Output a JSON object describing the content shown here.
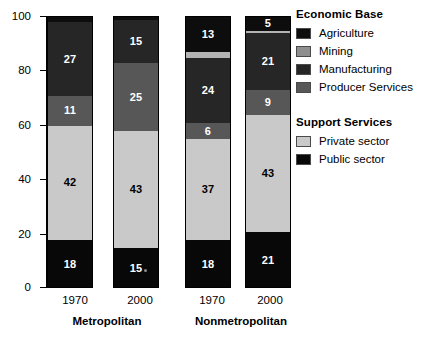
{
  "chart_data": {
    "type": "bar",
    "subtype": "stacked-100-percent",
    "title": "",
    "xlabel": "",
    "ylabel": "",
    "ylim": [
      0,
      100
    ],
    "yticks": [
      0,
      20,
      40,
      60,
      80,
      100
    ],
    "ytick_labels": [
      "0",
      "20",
      "40",
      "60",
      "80",
      "100"
    ],
    "grid": false,
    "legend_position": "right",
    "categories": [
      "1970",
      "2000",
      "1970",
      "2000"
    ],
    "groups": [
      {
        "label": "Metropolitan",
        "categories": [
          "1970",
          "2000"
        ]
      },
      {
        "label": "Nonmetropolitan",
        "categories": [
          "1970",
          "2000"
        ]
      }
    ],
    "series": [
      {
        "name": "Agriculture",
        "color": "#0d0d0d",
        "values": [
          2,
          1,
          13,
          5
        ]
      },
      {
        "name": "Mining",
        "color": "#b3b3b3",
        "values": [
          0,
          0,
          2,
          1
        ]
      },
      {
        "name": "Manufacturing",
        "color": "#262626",
        "values": [
          27,
          15,
          24,
          21
        ]
      },
      {
        "name": "Producer Services",
        "color": "#575757",
        "values": [
          11,
          25,
          6,
          9
        ]
      },
      {
        "name": "Private sector",
        "color": "#c9c9c9",
        "values": [
          42,
          43,
          37,
          43
        ]
      },
      {
        "name": "Public sector",
        "color": "#080808",
        "values": [
          18,
          15,
          18,
          21
        ]
      }
    ],
    "bars": [
      {
        "id": "metro-1970",
        "group": "Metropolitan",
        "category": "1970",
        "segments": [
          {
            "series": "Agriculture",
            "value": 2,
            "label": "",
            "label_color": "light"
          },
          {
            "series": "Manufacturing",
            "value": 27,
            "label": "27",
            "label_color": "light"
          },
          {
            "series": "Producer Services",
            "value": 11,
            "label": "11",
            "label_color": "light"
          },
          {
            "series": "Private sector",
            "value": 42,
            "label": "42",
            "label_color": "dark"
          },
          {
            "series": "Public sector",
            "value": 18,
            "label": "18",
            "label_color": "light"
          }
        ]
      },
      {
        "id": "metro-2000",
        "group": "Metropolitan",
        "category": "2000",
        "segments": [
          {
            "series": "Agriculture",
            "value": 1,
            "label": "",
            "label_color": "light"
          },
          {
            "series": "Manufacturing",
            "value": 16,
            "label": "15",
            "label_color": "light"
          },
          {
            "series": "Producer Services",
            "value": 25,
            "label": "25",
            "label_color": "light"
          },
          {
            "series": "Private sector",
            "value": 43,
            "label": "43",
            "label_color": "dark"
          },
          {
            "series": "Public sector",
            "value": 15,
            "label": "15",
            "label_color": "light"
          }
        ]
      },
      {
        "id": "nonmetro-1970",
        "group": "Nonmetropolitan",
        "category": "1970",
        "segments": [
          {
            "series": "Agriculture",
            "value": 13,
            "label": "13",
            "label_color": "light"
          },
          {
            "series": "Mining",
            "value": 2,
            "label": "",
            "label_color": "dark"
          },
          {
            "series": "Manufacturing",
            "value": 24,
            "label": "24",
            "label_color": "light"
          },
          {
            "series": "Producer Services",
            "value": 6,
            "label": "6",
            "label_color": "light"
          },
          {
            "series": "Private sector",
            "value": 37,
            "label": "37",
            "label_color": "dark"
          },
          {
            "series": "Public sector",
            "value": 18,
            "label": "18",
            "label_color": "light"
          }
        ]
      },
      {
        "id": "nonmetro-2000",
        "group": "Nonmetropolitan",
        "category": "2000",
        "segments": [
          {
            "series": "Agriculture",
            "value": 5,
            "label": "5",
            "label_color": "light"
          },
          {
            "series": "Mining",
            "value": 1,
            "label": "",
            "label_color": "dark"
          },
          {
            "series": "Manufacturing",
            "value": 21,
            "label": "21",
            "label_color": "light"
          },
          {
            "series": "Producer Services",
            "value": 9,
            "label": "9",
            "label_color": "light"
          },
          {
            "series": "Private sector",
            "value": 43,
            "label": "43",
            "label_color": "dark"
          },
          {
            "series": "Public sector",
            "value": 21,
            "label": "21",
            "label_color": "light"
          }
        ]
      }
    ]
  },
  "axis": {
    "y_tick_labels": [
      "100",
      "80",
      "60",
      "40",
      "20",
      "0"
    ]
  },
  "x_axis": {
    "category_labels": [
      "1970",
      "2000",
      "1970",
      "2000"
    ],
    "group_labels": [
      "Metropolitan",
      "Nonmetropolitan"
    ]
  },
  "legend": {
    "blocks": [
      {
        "title": "Economic Base",
        "items": [
          {
            "label": "Agriculture",
            "color": "#0d0d0d"
          },
          {
            "label": "Mining",
            "color": "#8f8f8f"
          },
          {
            "label": "Manufacturing",
            "color": "#262626"
          },
          {
            "label": "Producer Services",
            "color": "#575757"
          }
        ]
      },
      {
        "title": "Support Services",
        "items": [
          {
            "label": "Private sector",
            "color": "#c9c9c9"
          },
          {
            "label": "Public sector",
            "color": "#080808"
          }
        ]
      }
    ]
  }
}
